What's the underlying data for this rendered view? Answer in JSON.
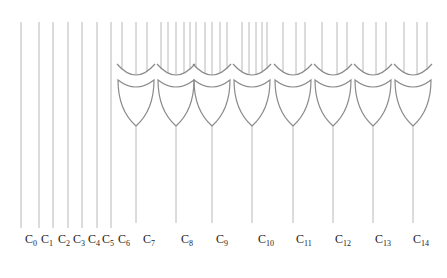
{
  "diagram": {
    "type": "logic-circuit",
    "colors": {
      "wire": "#b8b8b8",
      "gate": "#8a8a8a",
      "label": "#222222",
      "background": "#ffffff"
    },
    "direct_wires": [
      {
        "id": "C0",
        "x": 21
      },
      {
        "id": "C1",
        "x": 39
      },
      {
        "id": "C2",
        "x": 53
      },
      {
        "id": "C3",
        "x": 68
      },
      {
        "id": "C4",
        "x": 82
      },
      {
        "id": "C5",
        "x": 97
      },
      {
        "id": "C6",
        "x": 111
      }
    ],
    "gates": [
      {
        "id": "C7",
        "type": "OR",
        "cx": 136,
        "inputs": [
          122,
          136,
          147
        ]
      },
      {
        "id": "C8",
        "type": "OR",
        "cx": 176,
        "inputs": [
          161,
          168,
          176,
          184,
          190
        ]
      },
      {
        "id": "C9",
        "type": "OR",
        "cx": 212,
        "inputs": [
          196,
          205,
          212,
          220,
          227
        ]
      },
      {
        "id": "C10",
        "type": "OR",
        "cx": 252,
        "inputs": [
          242,
          249,
          256,
          262,
          267
        ]
      },
      {
        "id": "C11",
        "type": "OR",
        "cx": 293,
        "inputs": [
          283,
          296,
          305
        ]
      },
      {
        "id": "C12",
        "type": "OR",
        "cx": 333,
        "inputs": [
          322,
          337,
          347
        ]
      },
      {
        "id": "C13",
        "type": "OR",
        "cx": 373,
        "inputs": [
          363,
          376,
          386
        ]
      },
      {
        "id": "C14",
        "type": "OR",
        "cx": 413,
        "inputs": [
          404,
          417,
          427
        ]
      }
    ],
    "labels": [
      {
        "base": "C",
        "sub": "0",
        "x": 25
      },
      {
        "base": "C",
        "sub": "1",
        "x": 41
      },
      {
        "base": "C",
        "sub": "2",
        "x": 58
      },
      {
        "base": "C",
        "sub": "3",
        "x": 73
      },
      {
        "base": "C",
        "sub": "4",
        "x": 88
      },
      {
        "base": "C",
        "sub": "5",
        "x": 102
      },
      {
        "base": "C",
        "sub": "6",
        "x": 118
      },
      {
        "base": "C",
        "sub": "7",
        "x": 143
      },
      {
        "base": "C",
        "sub": "8",
        "x": 181
      },
      {
        "base": "C",
        "sub": "9",
        "x": 216
      },
      {
        "base": "C",
        "sub": "10",
        "x": 258
      },
      {
        "base": "C",
        "sub": "11",
        "x": 296
      },
      {
        "base": "C",
        "sub": "12",
        "x": 335
      },
      {
        "base": "C",
        "sub": "13",
        "x": 375
      },
      {
        "base": "C",
        "sub": "14",
        "x": 413
      }
    ]
  }
}
